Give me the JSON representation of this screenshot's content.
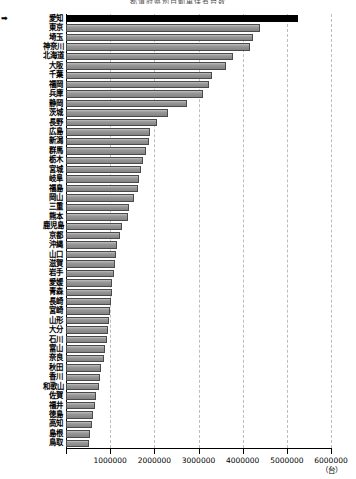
{
  "chart": {
    "title": "都道府県別自動車保有台数",
    "unit_label": "（台）",
    "marker_glyph": "➡",
    "highlight_color": "#000000",
    "bar_color": "#8c8c8c",
    "bar_edge_color": "#4a4a4a",
    "grid_color": "#bdbdbd"
  },
  "chart_data": {
    "type": "bar",
    "orientation": "horizontal",
    "title": "都道府県別自動車保有台数",
    "xlabel": "（台）",
    "ylabel": "",
    "xlim": [
      0,
      6000000
    ],
    "xticks": [
      0,
      1000000,
      2000000,
      3000000,
      4000000,
      5000000,
      6000000
    ],
    "xticklabels": [
      "",
      "1000000",
      "2000000",
      "3000000",
      "4000000",
      "5000000",
      "6000000"
    ],
    "grid": true,
    "legend": "none",
    "highlight_category": "愛知",
    "annotations": [
      "➡ 愛知"
    ],
    "categories": [
      "愛知",
      "東京",
      "埼玉",
      "神奈川",
      "北海道",
      "大阪",
      "千葉",
      "福岡",
      "兵庫",
      "静岡",
      "茨城",
      "長野",
      "広島",
      "新潟",
      "群馬",
      "栃木",
      "宮城",
      "岐阜",
      "福島",
      "岡山",
      "三重",
      "熊本",
      "鹿児島",
      "京都",
      "沖縄",
      "山口",
      "滋賀",
      "岩手",
      "愛媛",
      "青森",
      "長崎",
      "宮崎",
      "山形",
      "大分",
      "石川",
      "富山",
      "奈良",
      "秋田",
      "香川",
      "和歌山",
      "佐賀",
      "福井",
      "徳島",
      "高知",
      "島根",
      "鳥取"
    ],
    "values": [
      5250000,
      4400000,
      4230000,
      4170000,
      3770000,
      3620000,
      3300000,
      3230000,
      3100000,
      2750000,
      2320000,
      2060000,
      1900000,
      1870000,
      1800000,
      1740000,
      1700000,
      1660000,
      1620000,
      1550000,
      1430000,
      1400000,
      1270000,
      1230000,
      1150000,
      1130000,
      1110000,
      1080000,
      1050000,
      1040000,
      1020000,
      1000000,
      970000,
      950000,
      930000,
      880000,
      860000,
      800000,
      760000,
      740000,
      690000,
      650000,
      610000,
      580000,
      550000,
      510000
    ]
  }
}
